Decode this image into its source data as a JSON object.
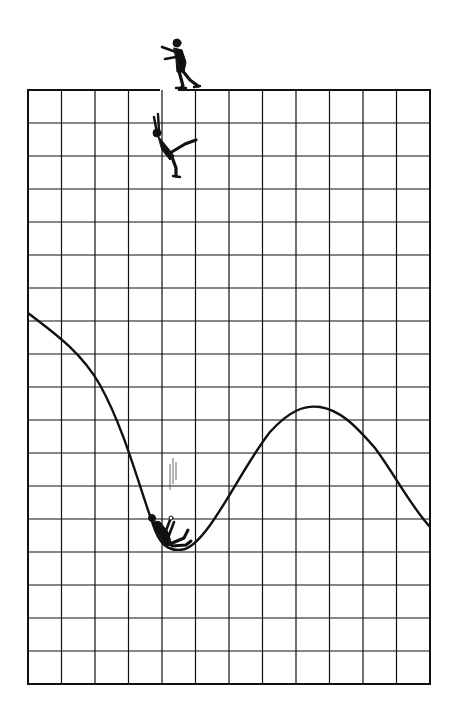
{
  "illustration": {
    "description": "Ink cartoon: a figure walks off a grid edge, falls, and lands at the bottom of a curve plotted on the grid",
    "background_color": "#ffffff",
    "ink_color": "#111111",
    "grid": {
      "left": 28,
      "top": 90,
      "right": 430,
      "bottom": 684,
      "columns": 12,
      "rows": 18,
      "top_edge_gap": {
        "from_x": 160,
        "to_x": 178
      }
    },
    "curve": {
      "start": [
        28,
        313
      ],
      "trough": [
        176,
        549
      ],
      "peak": [
        313,
        406
      ],
      "end": [
        430,
        527
      ]
    },
    "figures": [
      {
        "name": "walking-man",
        "pose": "walking off the edge, arms outstretched",
        "x": 180,
        "y": 40
      },
      {
        "name": "falling-man",
        "pose": "tumbling down, arms up, leg kicked out",
        "x": 170,
        "y": 140
      },
      {
        "name": "landed-man",
        "pose": "sprawled at the bottom of the curve",
        "x": 170,
        "y": 528
      }
    ],
    "motion_lines": {
      "x": 175,
      "y_from": 460,
      "y_to": 500
    }
  }
}
